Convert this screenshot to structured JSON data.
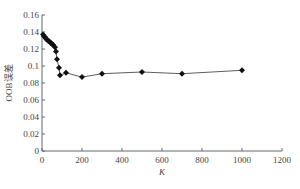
{
  "chart_data": {
    "type": "line",
    "title": "",
    "xlabel": "K",
    "ylabel": "OOB误差",
    "xlim": [
      0,
      1200
    ],
    "ylim": [
      0,
      0.16
    ],
    "xticks": [
      0,
      200,
      400,
      600,
      800,
      1000,
      1200
    ],
    "yticks": [
      0,
      0.02,
      0.04,
      0.06,
      0.08,
      0.1,
      0.12,
      0.14,
      0.16
    ],
    "xtick_labels": [
      "0",
      "200",
      "400",
      "600",
      "800",
      "1000",
      "1200"
    ],
    "ytick_labels": [
      "0",
      "0.02",
      "0.04",
      "0.06",
      "0.08",
      "0.1",
      "0.12",
      "0.14",
      "0.16"
    ],
    "grid": false,
    "legend": null,
    "marker": "diamond",
    "series": [
      {
        "name": "OOB误差",
        "x": [
          5,
          10,
          15,
          20,
          25,
          30,
          35,
          40,
          45,
          50,
          55,
          65,
          70,
          75,
          85,
          90,
          120,
          200,
          300,
          500,
          700,
          1000
        ],
        "values": [
          0.137,
          0.135,
          0.134,
          0.132,
          0.131,
          0.13,
          0.129,
          0.128,
          0.127,
          0.126,
          0.125,
          0.122,
          0.117,
          0.108,
          0.098,
          0.089,
          0.092,
          0.087,
          0.091,
          0.093,
          0.091,
          0.095
        ]
      }
    ]
  },
  "colors": {
    "axis": "#666666",
    "line": "#333333",
    "marker": "#111111"
  }
}
